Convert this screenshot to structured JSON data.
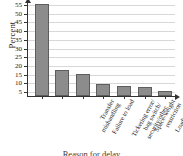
{
  "chart_data": {
    "type": "bar",
    "title": "",
    "xlabel": "Reason for delay",
    "ylabel": "Percent",
    "ylim": [
      0,
      57
    ],
    "yticks": [
      5,
      10,
      15,
      20,
      25,
      30,
      35,
      40,
      45,
      50,
      55
    ],
    "grid": true,
    "legend": "none",
    "categories": [
      "Transfer\nmishandling",
      "Failure to load",
      "Ticketing error/\nbag switch/\nsecurity/other",
      "Space-weight\nrestriction",
      "Loading error",
      "Arrival\nmishandling",
      "Tagging error"
    ],
    "values": [
      53,
      15,
      12.5,
      7,
      5.5,
      5,
      3
    ],
    "bar_color": "#8c8c8c",
    "bar_edge_color": "#5d5d5d",
    "grid_color": "#d8d8d8",
    "axis_color": "#333333",
    "background": "#ffffff"
  }
}
